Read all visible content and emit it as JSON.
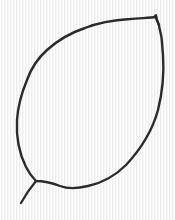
{
  "image": {
    "description": "Hand-drawn outline sketch of a leaf with a short stem",
    "subject": "leaf",
    "colors": {
      "background": "#f5f5f5",
      "stroke": "#2b2b2b"
    },
    "stroke_width": 2.4
  }
}
